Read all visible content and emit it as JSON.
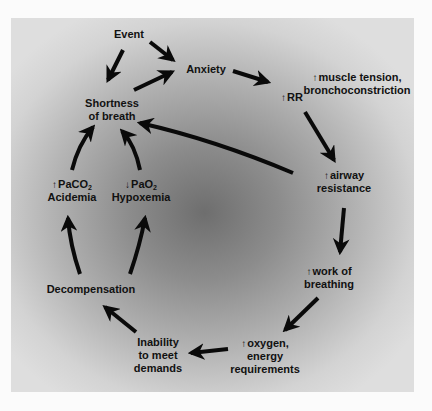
{
  "diagram": {
    "title": "",
    "colors": {
      "arrow": "#0a0a0a",
      "text": "#111111",
      "panel_edge": "#dedede",
      "panel_center": "#6e6e6e"
    },
    "nodes": {
      "event": {
        "lines": [
          "Event"
        ]
      },
      "anxiety": {
        "lines": [
          "Anxiety"
        ]
      },
      "muscle_tension": {
        "prefix": "↑",
        "lines": [
          "muscle tension,",
          "bronchoconstriction"
        ]
      },
      "rr": {
        "prefix": "↑",
        "lines": [
          "RR"
        ]
      },
      "airway_resistance": {
        "prefix": "↑",
        "lines": [
          "airway",
          "resistance"
        ]
      },
      "work_of_breathing": {
        "prefix": "↑",
        "lines": [
          "work of",
          "breathing"
        ]
      },
      "oxygen_energy": {
        "prefix": "↑",
        "lines": [
          "oxygen,",
          "energy",
          "requirements"
        ]
      },
      "inability": {
        "lines": [
          "Inability",
          "to meet",
          "demands"
        ]
      },
      "decompensation": {
        "lines": [
          "Decompensation"
        ]
      },
      "paco2": {
        "prefix": "↑",
        "base": "PaCO",
        "sub": "2",
        "line2": "Acidemia"
      },
      "pao2": {
        "prefix": "↓",
        "base": "PaO",
        "sub": "2",
        "line2": "Hypoxemia"
      },
      "shortness_of_breath": {
        "lines": [
          "Shortness",
          "of breath"
        ]
      }
    },
    "edges": [
      {
        "from": "Event",
        "to": "Anxiety"
      },
      {
        "from": "Event",
        "to": "Shortness of breath"
      },
      {
        "from": "Shortness of breath",
        "to": "Anxiety"
      },
      {
        "from": "Anxiety",
        "to": "↑RR"
      },
      {
        "from": "↑RR",
        "to": "↑airway resistance"
      },
      {
        "from": "↑airway resistance",
        "to": "Shortness of breath"
      },
      {
        "from": "↑airway resistance",
        "to": "↑work of breathing"
      },
      {
        "from": "↑work of breathing",
        "to": "↑oxygen, energy requirements"
      },
      {
        "from": "↑oxygen, energy requirements",
        "to": "Inability to meet demands"
      },
      {
        "from": "Inability to meet demands",
        "to": "Decompensation"
      },
      {
        "from": "Decompensation",
        "to": "↑PaCO2 Acidemia"
      },
      {
        "from": "Decompensation",
        "to": "↓PaO2 Hypoxemia"
      },
      {
        "from": "↑PaCO2 Acidemia",
        "to": "Shortness of breath"
      },
      {
        "from": "↓PaO2 Hypoxemia",
        "to": "Shortness of breath"
      }
    ]
  }
}
